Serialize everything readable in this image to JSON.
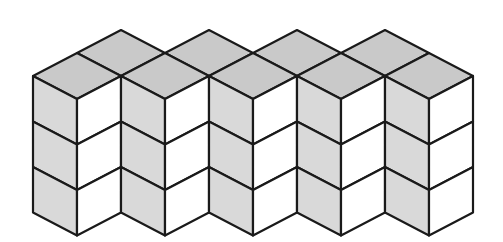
{
  "diagram": {
    "type": "isometric-cube-stack",
    "front_columns": 5,
    "back_columns": 4,
    "layers": 3,
    "total_cubes": 27,
    "geometry": {
      "origin_x": 77,
      "top_y": 53,
      "half_width": 44,
      "col_step": 88,
      "rhombus_half_height": 23,
      "cube_height": 45.5
    },
    "colors": {
      "background": "#ffffff",
      "top_face": "#c9c9c9",
      "left_face": "#d9d9d9",
      "right_face": "#ffffff",
      "stroke": "#1a1a1a"
    },
    "stroke_width": 2.2
  }
}
